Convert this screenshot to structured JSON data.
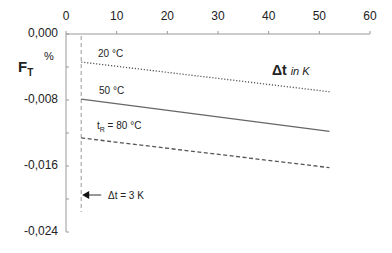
{
  "chart_data": {
    "type": "line",
    "title": "",
    "xlabel": "Δt in K",
    "xlabel_main": "Δt",
    "xlabel_unit": "in K",
    "ylabel": "F_T",
    "ylabel_main": "F",
    "ylabel_sub": "T",
    "yunit": "%",
    "xlim": [
      0,
      60
    ],
    "ylim": [
      -0.024,
      0.0
    ],
    "x_ticks": [
      "0",
      "10",
      "20",
      "30",
      "40",
      "50",
      "60"
    ],
    "y_ticks": [
      "0,000",
      "-0,008",
      "-0,016",
      "-0,024"
    ],
    "x_axis_position": "top",
    "grid": false,
    "legend": "inline labels",
    "series": [
      {
        "name": "20 °C",
        "style": "dotted",
        "x": [
          3,
          52
        ],
        "y": [
          -0.0034,
          -0.007
        ]
      },
      {
        "name": "50 °C",
        "style": "solid",
        "x": [
          3,
          52
        ],
        "y": [
          -0.0079,
          -0.0118
        ]
      },
      {
        "name": "t_R = 80 °C",
        "style": "dashed",
        "x": [
          3,
          52
        ],
        "y": [
          -0.0126,
          -0.0162
        ]
      }
    ],
    "annotations": [
      {
        "text": "Δt = 3 K",
        "type": "vertical-dashed-line",
        "x": 3,
        "arrow": "left"
      }
    ]
  },
  "labels": {
    "series_20": "20 °C",
    "series_50": "50 °C",
    "series_80_prefix": "t",
    "series_80_sub": "R",
    "series_80_suffix": " = 80 °C",
    "delta_annotation": "Δt = 3 K"
  }
}
